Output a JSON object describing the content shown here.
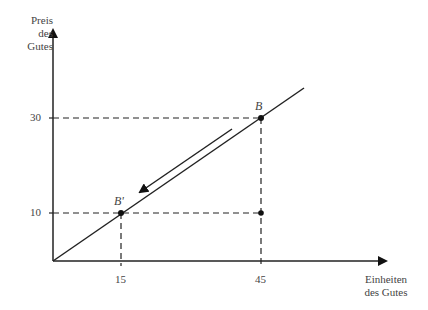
{
  "diagram": {
    "y_axis_label": [
      "Preis",
      "des",
      "Gutes"
    ],
    "x_axis_label": [
      "Einheiten",
      "des Gutes"
    ],
    "y_ticks": [
      "30",
      "10"
    ],
    "x_ticks": [
      "15",
      "45"
    ],
    "points": [
      {
        "label": "B",
        "x": 45,
        "y": 30
      },
      {
        "label": "B'",
        "x": 15,
        "y": 10
      }
    ],
    "extra_dot": {
      "x": 45,
      "y": 10
    },
    "arrow_direction": "from B toward B' (down along line)"
  }
}
